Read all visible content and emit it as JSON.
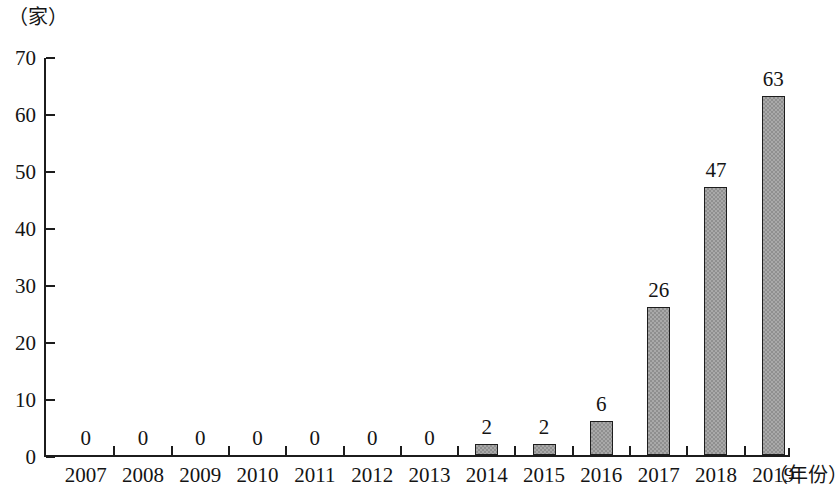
{
  "chart_data": {
    "type": "bar",
    "title": "",
    "subtitle": "",
    "xlabel": "（年份）",
    "ylabel": "（家）",
    "categories": [
      "2007",
      "2008",
      "2009",
      "2010",
      "2011",
      "2012",
      "2013",
      "2014",
      "2015",
      "2016",
      "2017",
      "2018",
      "2019"
    ],
    "values": [
      0,
      0,
      0,
      0,
      0,
      0,
      0,
      2,
      2,
      6,
      26,
      47,
      63
    ],
    "value_labels": [
      "0",
      "0",
      "0",
      "0",
      "0",
      "0",
      "0",
      "2",
      "2",
      "6",
      "26",
      "47",
      "63"
    ],
    "ylim": [
      0,
      70
    ],
    "ytick_labels": [
      "0",
      "10",
      "20",
      "30",
      "40",
      "50",
      "60",
      "70"
    ],
    "ytick_values": [
      0,
      10,
      20,
      30,
      40,
      50,
      60,
      70
    ],
    "grid": false,
    "legend": null,
    "legend_position": "none",
    "series": [
      {
        "name": "",
        "values": [
          0,
          0,
          0,
          0,
          0,
          0,
          0,
          2,
          2,
          6,
          26,
          47,
          63
        ]
      }
    ],
    "colors": {
      "bar_fill": "#a9a9a9",
      "bar_hatch": "#8f8f8f",
      "bar_border": "#1d1d1d",
      "axis": "#1c1c1c",
      "text": "#141414",
      "background": "#ffffff"
    }
  }
}
